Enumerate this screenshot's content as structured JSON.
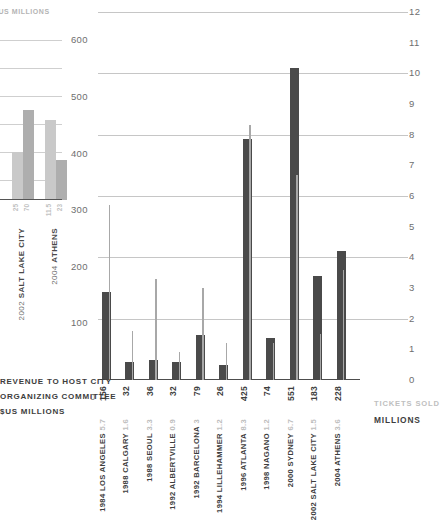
{
  "fragment_chart": {
    "header": "$US MILLIONS",
    "bars": [
      {
        "city": "SALT LAKE CITY",
        "year": "2002",
        "value_a": "25",
        "value_b": "70"
      },
      {
        "city": "ATHENS",
        "year": "2004",
        "value_a": "11.5",
        "value_b": "23"
      }
    ]
  },
  "labels": {
    "left_caption_line1": "REVENUE TO HOST CITY",
    "left_caption_line2": "ORGANIZING COMMITTEE",
    "left_caption_line3": "$US MILLIONS",
    "left_zero_tick": "0",
    "right_caption_line1": "TICKETS SOLD",
    "right_caption_line2": "MILLIONS"
  },
  "chart_data": {
    "type": "bar",
    "title": "",
    "xlabel": "",
    "ylabel": "REVENUE TO HOST CITY ORGANIZING COMMITTEE $US MILLIONS",
    "y2label": "TICKETS SOLD MILLIONS",
    "ylim": [
      0,
      650
    ],
    "y2lim": [
      0,
      12
    ],
    "yticks": [
      "0",
      "100",
      "200",
      "300",
      "400",
      "500",
      "600"
    ],
    "y2ticks": [
      "0",
      "1",
      "2",
      "3",
      "4",
      "5",
      "6",
      "7",
      "8",
      "9",
      "10",
      "11",
      "12"
    ],
    "grid": true,
    "legend": "none",
    "categories": [
      "1984 LOS ANGELES",
      "1988 CALGARY",
      "1988 SEOUL",
      "1992 ALBERTVILLE",
      "1992 BARCELONA",
      "1994 LILLEHAMMER",
      "1996 ATLANTA",
      "1998 NAGANO",
      "2000 SYDNEY",
      "2002 SALT LAKE CITY",
      "2004 ATHENS"
    ],
    "years": [
      "1984",
      "1988",
      "1988",
      "1992",
      "1992",
      "1994",
      "1996",
      "1998",
      "2000",
      "2002",
      "2004"
    ],
    "cities": [
      "LOS ANGELES",
      "CALGARY",
      "SEOUL",
      "ALBERTVILLE",
      "BARCELONA",
      "LILLEHAMMER",
      "ATLANTA",
      "NAGANO",
      "SYDNEY",
      "SALT LAKE CITY",
      "ATHENS"
    ],
    "series": [
      {
        "name": "REVENUE TO HOST CITY ORGANIZING COMMITTEE",
        "axis": "left",
        "units": "$US MILLIONS",
        "color": "#4a4a4a",
        "values": [
          156,
          32,
          36,
          32,
          79,
          26,
          425,
          74,
          551,
          183,
          228
        ],
        "labels": [
          "156",
          "32",
          "36",
          "32",
          "79",
          "26",
          "425",
          "74",
          "551",
          "183",
          "228"
        ]
      },
      {
        "name": "TICKETS SOLD",
        "axis": "right",
        "units": "MILLIONS",
        "color": "#a8a8a8",
        "values": [
          5.7,
          1.6,
          3.3,
          0.9,
          3,
          1.2,
          8.3,
          1.2,
          6.7,
          1.5,
          3.6
        ],
        "labels": [
          "5.7",
          "1.6",
          "3.3",
          "0.9",
          "3",
          "1.2",
          "8.3",
          "1.2",
          "6.7",
          "1.5",
          "3.6"
        ]
      }
    ]
  }
}
